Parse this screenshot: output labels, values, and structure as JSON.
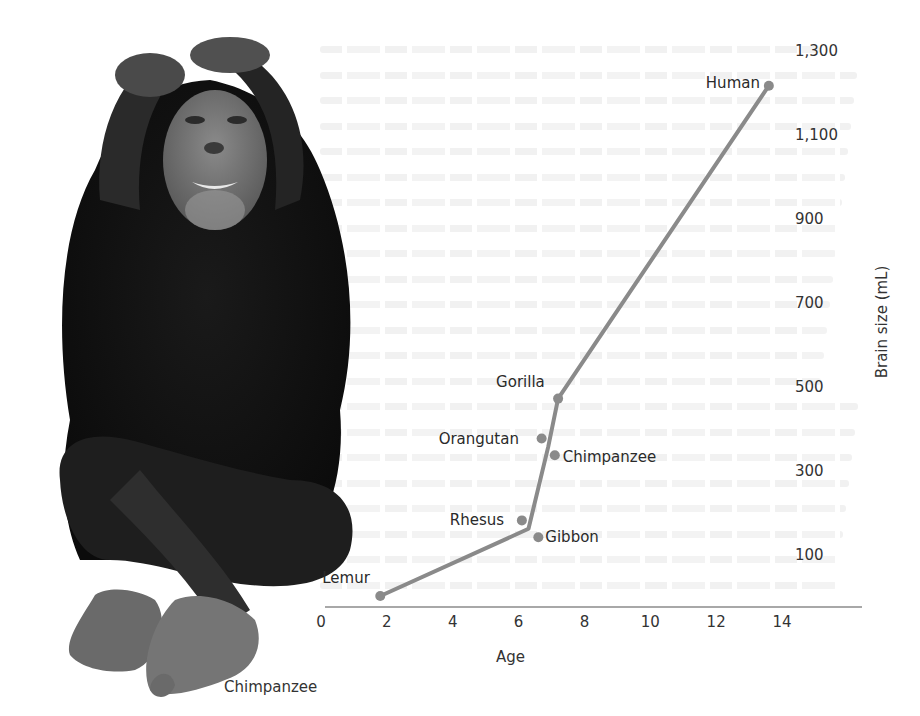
{
  "figure": {
    "photo_caption": "Chimpanzee",
    "photo_subject": "chimpanzee-photo"
  },
  "chart_data": {
    "type": "line",
    "title": "",
    "xlabel": "Age",
    "ylabel": "Brain size (mL)",
    "xlim": [
      0,
      16
    ],
    "ylim": [
      -25,
      1350
    ],
    "x_ticks": [
      "0",
      "2",
      "4",
      "6",
      "8",
      "10",
      "12",
      "14"
    ],
    "y_ticks": [
      "1,300",
      "1,100",
      "900",
      "700",
      "500",
      "300",
      "100"
    ],
    "grid": false,
    "legend": null,
    "line_color": "#8a8a8a",
    "series": [
      {
        "name": "Primates",
        "points": [
          {
            "label": "Lemur",
            "x": 1.8,
            "y": 0,
            "on_line": true
          },
          {
            "label": "Rhesus",
            "x": 6.1,
            "y": 180,
            "on_line": false
          },
          {
            "label": "Gibbon",
            "x": 6.6,
            "y": 140,
            "on_line": false
          },
          {
            "label": "Orangutan",
            "x": 6.7,
            "y": 375,
            "on_line": false
          },
          {
            "label": "Chimpanzee",
            "x": 7.1,
            "y": 335,
            "on_line": false
          },
          {
            "label": "Gorilla",
            "x": 7.2,
            "y": 470,
            "on_line": true
          },
          {
            "label": "Human",
            "x": 13.6,
            "y": 1215,
            "on_line": true
          }
        ],
        "line_path": [
          {
            "x": 1.8,
            "y": 0
          },
          {
            "x": 6.3,
            "y": 160
          },
          {
            "x": 6.9,
            "y": 355
          },
          {
            "x": 7.2,
            "y": 470
          },
          {
            "x": 13.6,
            "y": 1215
          }
        ]
      }
    ]
  }
}
